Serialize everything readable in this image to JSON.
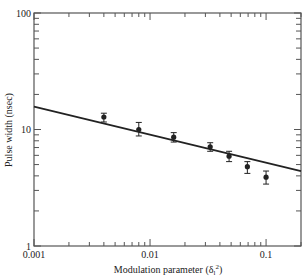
{
  "chart_data": {
    "type": "scatter",
    "title": "",
    "xlabel": "Modulation parameter (δₗ²)",
    "xlabel_parts": {
      "main": "Modulation parameter (δ",
      "sub": "l",
      "sup": "2",
      "end": ")"
    },
    "ylabel": "Pulse width (nsec)",
    "xscale": "log",
    "yscale": "log",
    "xlim": [
      0.001,
      0.2
    ],
    "ylim": [
      1,
      100
    ],
    "x_tick_labels": [
      "0.001",
      "0.01",
      "0.1"
    ],
    "y_tick_labels": [
      "1",
      "10",
      "100"
    ],
    "grid": false,
    "legend": null,
    "series": [
      {
        "name": "measured",
        "kind": "points_with_error_bars",
        "x": [
          0.004,
          0.008,
          0.016,
          0.033,
          0.048,
          0.069,
          0.1
        ],
        "y": [
          12.8,
          10.0,
          8.6,
          7.1,
          5.9,
          4.8,
          3.9
        ],
        "y_err_low": [
          1.2,
          1.2,
          0.8,
          0.6,
          0.6,
          0.6,
          0.5
        ],
        "y_err_high": [
          1.0,
          1.5,
          0.8,
          0.6,
          0.6,
          0.5,
          0.5
        ]
      },
      {
        "name": "fit",
        "kind": "line",
        "x": [
          0.001,
          0.2
        ],
        "y": [
          15.7,
          4.4
        ]
      }
    ]
  },
  "colors": {
    "ink": "#222222",
    "frame": "#555555",
    "background": "#ffffff"
  }
}
